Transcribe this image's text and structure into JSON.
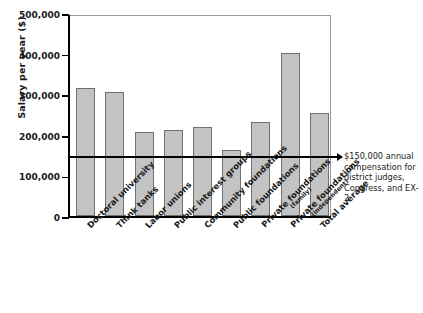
{
  "chart_data": {
    "type": "bar",
    "title": "",
    "xlabel": "",
    "ylabel": "Salary per year ($)",
    "ylim": [
      0,
      500000
    ],
    "yticks": [
      0,
      100000,
      200000,
      300000,
      400000,
      500000
    ],
    "ytick_labels": [
      "0",
      "100,000",
      "200,000",
      "300,000",
      "400,000",
      "500,000"
    ],
    "grid": false,
    "legend": false,
    "categories": [
      "Doctoral university",
      "Think tanks",
      "Labor unions",
      "Public interest groups",
      "Community foundations",
      "Public foundations",
      "Private foundations (family)",
      "Private foundations (independent)",
      "Total average"
    ],
    "category_labels": [
      {
        "main": "Doctoral university",
        "sub": ""
      },
      {
        "main": "Think tanks",
        "sub": ""
      },
      {
        "main": "Labor unions",
        "sub": ""
      },
      {
        "main": "Public interest groups",
        "sub": ""
      },
      {
        "main": "Community foundations",
        "sub": ""
      },
      {
        "main": "Public foundations",
        "sub": ""
      },
      {
        "main": "Private foundations",
        "sub": "(family)"
      },
      {
        "main": "Private foundations",
        "sub": "(independent)"
      },
      {
        "main": "Total average",
        "sub": ""
      }
    ],
    "values": [
      315000,
      305000,
      208000,
      212000,
      220000,
      163000,
      232000,
      402000,
      253000
    ],
    "bar_color": "#c3c3c3",
    "bar_edge_color": "#6f6f6f",
    "reference_line": {
      "value": 150000,
      "color": "#000000",
      "annotation": "$150,000 annual compensation for district judges, Congress, and EX-2"
    }
  }
}
